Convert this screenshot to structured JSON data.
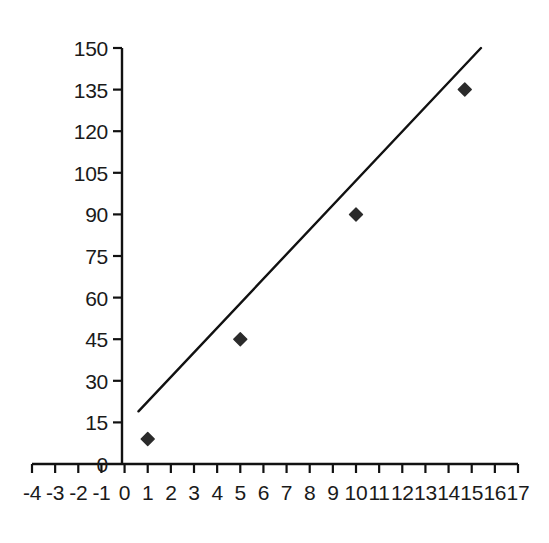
{
  "chart_data": {
    "type": "scatter",
    "title": "",
    "subtitle": "",
    "xlabel": "",
    "ylabel": "",
    "xlim": [
      -4,
      17
    ],
    "ylim": [
      0,
      150
    ],
    "xticks": [
      -4,
      -3,
      -2,
      -1,
      0,
      1,
      2,
      3,
      4,
      5,
      6,
      7,
      8,
      9,
      10,
      11,
      12,
      13,
      14,
      15,
      16,
      17
    ],
    "xtick_labels": [
      "-4",
      "-3",
      "-2",
      "-1",
      "0",
      "1",
      "2",
      "3",
      "4",
      "5",
      "6",
      "7",
      "8",
      "9",
      "10",
      "11",
      "12",
      "13",
      "14",
      "15",
      "16",
      "17"
    ],
    "yticks": [
      0,
      15,
      30,
      45,
      60,
      75,
      90,
      105,
      120,
      135,
      150
    ],
    "ytick_labels": [
      "0",
      "15",
      "30",
      "45",
      "60",
      "75",
      "90",
      "105",
      "120",
      "135",
      "150"
    ],
    "grid": false,
    "legend": false,
    "legend_position": "none",
    "series": [
      {
        "name": "data points",
        "type": "scatter",
        "marker": "diamond",
        "marker_size": 13,
        "color": "#2b2b2b",
        "points": [
          {
            "x": 1,
            "y": 9
          },
          {
            "x": 5,
            "y": 45
          },
          {
            "x": 10,
            "y": 90
          },
          {
            "x": 14.7,
            "y": 135
          }
        ]
      },
      {
        "name": "trend line",
        "type": "line",
        "color": "#111111",
        "line_width": 2.4,
        "points": [
          {
            "x": 0.6,
            "y": 19
          },
          {
            "x": 15.4,
            "y": 150
          }
        ]
      }
    ],
    "axis_color": "#111111",
    "background_color": "#ffffff",
    "text_color": "#1a1a1a"
  },
  "geometry": {
    "x_axis_pixel_left": 32,
    "x_axis_pixel_right": 518,
    "x_axis_baseline_y": 464,
    "y_axis_pixel_x": 122,
    "y_axis_top_y": 48,
    "y_axis_bottom_y": 464,
    "tick_length": 9
  },
  "accessibility": {
    "description": "Scatter plot with four dark diamond markers rising from lower left to upper right, and a straight trend line drawn through them."
  }
}
